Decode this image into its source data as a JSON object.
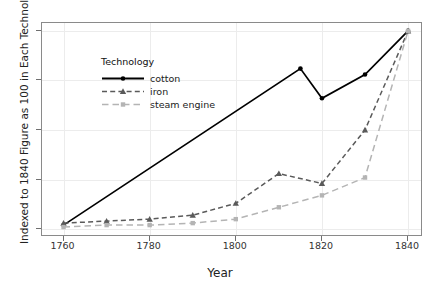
{
  "chart_data": {
    "type": "line",
    "title": "",
    "xlabel": "Year",
    "ylabel": "Indexed to 1840 Figure as 100 in Each Technology",
    "legend_title": "Technology",
    "legend_position": "top-left-inside",
    "grid": true,
    "xlim": [
      1755,
      1843
    ],
    "ylim": [
      -3,
      104
    ],
    "xticks": [
      1760,
      1780,
      1800,
      1820,
      1840
    ],
    "yticks": [
      0,
      25,
      50,
      75,
      100
    ],
    "x": [
      1760,
      1770,
      1780,
      1790,
      1800,
      1810,
      1820,
      1830,
      1840
    ],
    "series": [
      {
        "name": "cotton",
        "color": "#000000",
        "dash": "solid",
        "marker": "circle",
        "x": [
          1760,
          1815,
          1820,
          1830,
          1840
        ],
        "values": [
          2,
          81,
          66,
          78,
          100
        ]
      },
      {
        "name": "iron",
        "color": "#5a5a5a",
        "dash": "dashed",
        "marker": "triangle",
        "x": [
          1760,
          1770,
          1780,
          1790,
          1800,
          1810,
          1820,
          1830,
          1840
        ],
        "values": [
          3,
          4,
          5,
          7,
          13,
          28,
          23,
          50,
          100
        ]
      },
      {
        "name": "steam engine",
        "color": "#b4b4b4",
        "dash": "longdash",
        "marker": "square",
        "x": [
          1760,
          1770,
          1780,
          1790,
          1800,
          1810,
          1820,
          1830,
          1840
        ],
        "values": [
          1,
          2,
          2,
          3,
          5,
          11,
          17,
          26,
          100
        ]
      }
    ]
  },
  "axis": {
    "y_title": "Indexed to 1840 Figure as 100 in Each Technology",
    "x_title": "Year",
    "y_tick_labels": [
      "100",
      "75",
      "50",
      "25",
      "0"
    ],
    "x_tick_labels": [
      "1760",
      "1780",
      "1800",
      "1820",
      "1840"
    ]
  },
  "legend": {
    "title": "Technology",
    "entries": [
      {
        "label": "cotton"
      },
      {
        "label": "iron"
      },
      {
        "label": "steam engine"
      }
    ]
  }
}
